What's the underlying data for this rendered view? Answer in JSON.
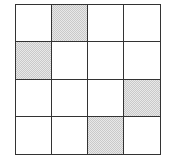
{
  "grid": {
    "rows": 4,
    "cols": 4,
    "line_color": "#333333",
    "shade_color": "#d6d6d6",
    "shaded_cells": [
      [
        0,
        1
      ],
      [
        1,
        0
      ],
      [
        2,
        3
      ],
      [
        3,
        2
      ]
    ],
    "cells": [
      [
        false,
        true,
        false,
        false
      ],
      [
        true,
        false,
        false,
        false
      ],
      [
        false,
        false,
        false,
        true
      ],
      [
        false,
        false,
        true,
        false
      ]
    ]
  }
}
